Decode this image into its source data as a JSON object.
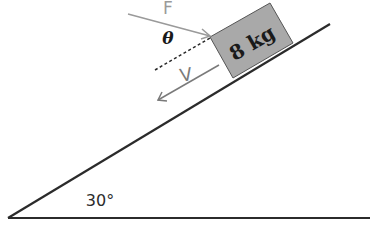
{
  "diagram": {
    "type": "inclined-plane",
    "block": {
      "label": "8 kg",
      "fill": "#a9a9a9"
    },
    "force": {
      "label": "F",
      "color": "#9a9a9a"
    },
    "angle_theta": {
      "label": "θ"
    },
    "velocity": {
      "label": "V",
      "color": "#7a7a7a"
    },
    "incline_angle": {
      "label": "30°"
    },
    "line_color": "#2b2b2b"
  }
}
